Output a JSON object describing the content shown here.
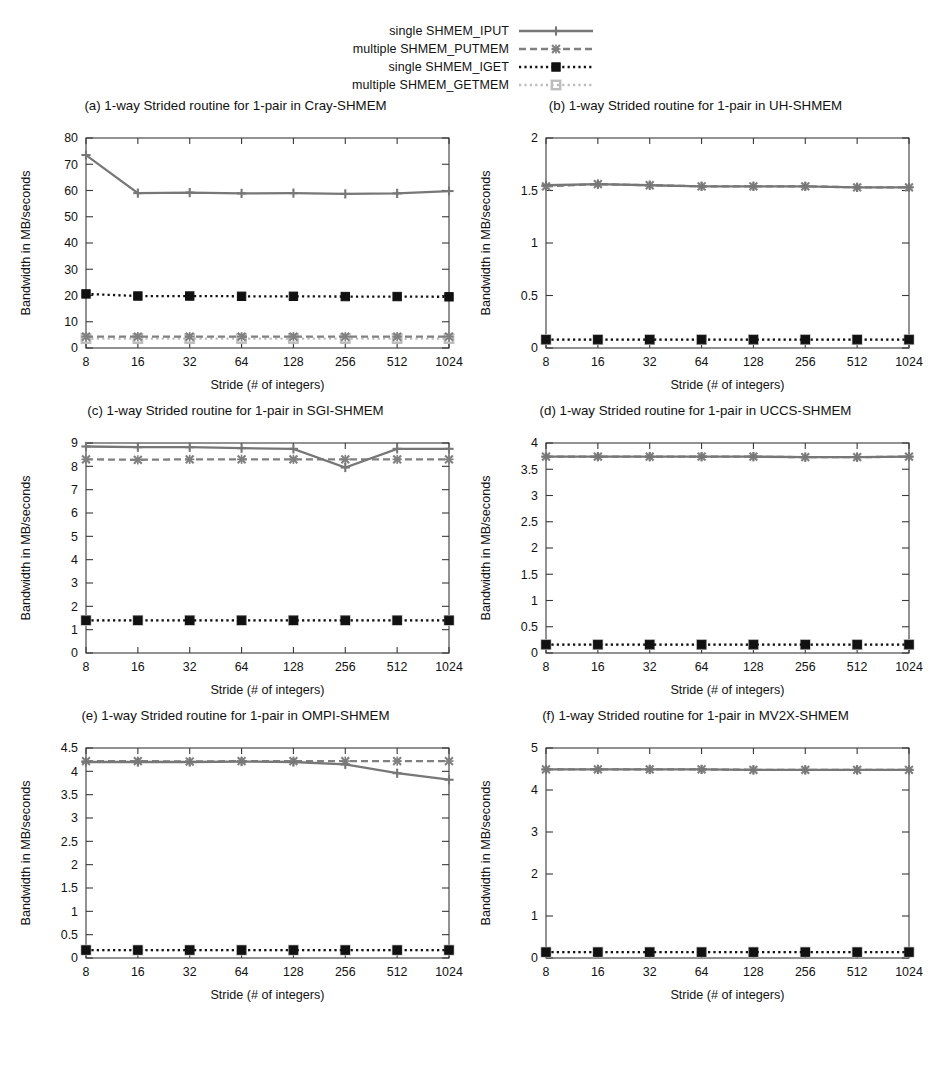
{
  "legend": {
    "entries": [
      {
        "label": "single SHMEM_IPUT",
        "key": "iput",
        "color": "#777777",
        "dash": "solid",
        "marker": "plus"
      },
      {
        "label": "multiple SHMEM_PUTMEM",
        "key": "putmem",
        "color": "#808080",
        "dash": "dashed",
        "marker": "cross"
      },
      {
        "label": "single SHMEM_IGET",
        "key": "iget",
        "color": "#111111",
        "dash": "dotted",
        "marker": "square-filled"
      },
      {
        "label": "multiple SHMEM_GETMEM",
        "key": "getmem",
        "color": "#bdbdbd",
        "dash": "dotted",
        "marker": "square-open"
      }
    ]
  },
  "axes": {
    "xlabel": "Stride (# of integers)",
    "ylabel": "Bandwidth in MB/seconds",
    "categories": [
      "8",
      "16",
      "32",
      "64",
      "128",
      "256",
      "512",
      "1024"
    ]
  },
  "chart_data": [
    {
      "id": "a",
      "type": "line",
      "title": "(a) 1-way Strided routine for 1-pair in Cray-SHMEM",
      "xlabel": "Stride (# of integers)",
      "ylabel": "Bandwidth in MB/seconds",
      "categories": [
        "8",
        "16",
        "32",
        "64",
        "128",
        "256",
        "512",
        "1024"
      ],
      "ylim": [
        0,
        80
      ],
      "yticks": [
        0,
        10,
        20,
        30,
        40,
        50,
        60,
        70,
        80
      ],
      "ytick_labels": [
        "0",
        "10",
        "20",
        "30",
        "40",
        "50",
        "60",
        "70",
        "80"
      ],
      "grid": false,
      "legend_position": "figure-top",
      "series": [
        {
          "name": "single SHMEM_IPUT",
          "values": [
            73.5,
            59.0,
            59.2,
            58.9,
            59.0,
            58.7,
            58.9,
            59.8
          ]
        },
        {
          "name": "multiple SHMEM_PUTMEM",
          "values": [
            4.3,
            4.3,
            4.3,
            4.3,
            4.3,
            4.3,
            4.3,
            4.3
          ]
        },
        {
          "name": "single SHMEM_IGET",
          "values": [
            20.6,
            19.8,
            19.8,
            19.7,
            19.7,
            19.6,
            19.6,
            19.5
          ]
        },
        {
          "name": "multiple SHMEM_GETMEM",
          "values": [
            3.6,
            3.6,
            3.6,
            3.6,
            3.6,
            3.6,
            3.6,
            3.6
          ]
        }
      ]
    },
    {
      "id": "b",
      "type": "line",
      "title": "(b) 1-way Strided routine for 1-pair in UH-SHMEM",
      "xlabel": "Stride (# of integers)",
      "ylabel": "Bandwidth in MB/seconds",
      "categories": [
        "8",
        "16",
        "32",
        "64",
        "128",
        "256",
        "512",
        "1024"
      ],
      "ylim": [
        0,
        2
      ],
      "yticks": [
        0,
        0.5,
        1,
        1.5,
        2
      ],
      "ytick_labels": [
        "0",
        "0.5",
        "1",
        "1.5",
        "2"
      ],
      "grid": false,
      "legend_position": "figure-top",
      "series": [
        {
          "name": "single SHMEM_IPUT",
          "values": [
            1.55,
            1.56,
            1.55,
            1.54,
            1.54,
            1.54,
            1.53,
            1.53
          ]
        },
        {
          "name": "multiple SHMEM_PUTMEM",
          "values": [
            1.54,
            1.56,
            1.55,
            1.54,
            1.54,
            1.54,
            1.53,
            1.53
          ]
        },
        {
          "name": "single SHMEM_IGET",
          "values": [
            0.08,
            0.08,
            0.08,
            0.08,
            0.08,
            0.08,
            0.08,
            0.08
          ]
        },
        {
          "name": "multiple SHMEM_GETMEM",
          "values": [
            0.08,
            0.08,
            0.08,
            0.08,
            0.08,
            0.08,
            0.08,
            0.08
          ]
        }
      ]
    },
    {
      "id": "c",
      "type": "line",
      "title": "(c) 1-way Strided routine for 1-pair in SGI-SHMEM",
      "xlabel": "Stride (# of integers)",
      "ylabel": "Bandwidth in MB/seconds",
      "categories": [
        "8",
        "16",
        "32",
        "64",
        "128",
        "256",
        "512",
        "1024"
      ],
      "ylim": [
        0,
        9
      ],
      "yticks": [
        0,
        1,
        2,
        3,
        4,
        5,
        6,
        7,
        8,
        9
      ],
      "ytick_labels": [
        "0",
        "1",
        "2",
        "3",
        "4",
        "5",
        "6",
        "7",
        "8",
        "9"
      ],
      "grid": false,
      "legend_position": "figure-top",
      "series": [
        {
          "name": "single SHMEM_IPUT",
          "values": [
            8.85,
            8.82,
            8.82,
            8.78,
            8.75,
            7.95,
            8.75,
            8.75
          ]
        },
        {
          "name": "multiple SHMEM_PUTMEM",
          "values": [
            8.3,
            8.28,
            8.3,
            8.3,
            8.3,
            8.3,
            8.3,
            8.3
          ]
        },
        {
          "name": "single SHMEM_IGET",
          "values": [
            1.4,
            1.4,
            1.4,
            1.4,
            1.4,
            1.4,
            1.4,
            1.4
          ]
        },
        {
          "name": "multiple SHMEM_GETMEM",
          "values": [
            1.4,
            1.4,
            1.4,
            1.4,
            1.4,
            1.4,
            1.4,
            1.4
          ]
        }
      ]
    },
    {
      "id": "d",
      "type": "line",
      "title": "(d) 1-way Strided routine for 1-pair in UCCS-SHMEM",
      "xlabel": "Stride (# of integers)",
      "ylabel": "Bandwidth in MB/seconds",
      "categories": [
        "8",
        "16",
        "32",
        "64",
        "128",
        "256",
        "512",
        "1024"
      ],
      "ylim": [
        0,
        4
      ],
      "yticks": [
        0,
        0.5,
        1,
        1.5,
        2,
        2.5,
        3,
        3.5,
        4
      ],
      "ytick_labels": [
        "0",
        "0.5",
        "1",
        "1.5",
        "2",
        "2.5",
        "3",
        "3.5",
        "4"
      ],
      "grid": false,
      "legend_position": "figure-top",
      "series": [
        {
          "name": "single SHMEM_IPUT",
          "values": [
            3.74,
            3.74,
            3.74,
            3.74,
            3.74,
            3.73,
            3.73,
            3.74
          ]
        },
        {
          "name": "multiple SHMEM_PUTMEM",
          "values": [
            3.74,
            3.74,
            3.74,
            3.74,
            3.74,
            3.73,
            3.73,
            3.74
          ]
        },
        {
          "name": "single SHMEM_IGET",
          "values": [
            0.16,
            0.16,
            0.16,
            0.16,
            0.16,
            0.16,
            0.16,
            0.16
          ]
        },
        {
          "name": "multiple SHMEM_GETMEM",
          "values": [
            0.16,
            0.16,
            0.16,
            0.16,
            0.16,
            0.16,
            0.16,
            0.16
          ]
        }
      ]
    },
    {
      "id": "e",
      "type": "line",
      "title": "(e) 1-way Strided routine for 1-pair in OMPI-SHMEM",
      "xlabel": "Stride (# of integers)",
      "ylabel": "Bandwidth in MB/seconds",
      "categories": [
        "8",
        "16",
        "32",
        "64",
        "128",
        "256",
        "512",
        "1024"
      ],
      "ylim": [
        0,
        4.5
      ],
      "yticks": [
        0,
        0.5,
        1,
        1.5,
        2,
        2.5,
        3,
        3.5,
        4,
        4.5
      ],
      "ytick_labels": [
        "0",
        "0.5",
        "1",
        "1.5",
        "2",
        "2.5",
        "3",
        "3.5",
        "4",
        "4.5"
      ],
      "grid": false,
      "legend_position": "figure-top",
      "series": [
        {
          "name": "single SHMEM_IPUT",
          "values": [
            4.2,
            4.2,
            4.2,
            4.21,
            4.2,
            4.15,
            3.96,
            3.82
          ]
        },
        {
          "name": "multiple SHMEM_PUTMEM",
          "values": [
            4.22,
            4.22,
            4.21,
            4.22,
            4.22,
            4.22,
            4.22,
            4.22
          ]
        },
        {
          "name": "single SHMEM_IGET",
          "values": [
            0.17,
            0.17,
            0.17,
            0.17,
            0.17,
            0.17,
            0.17,
            0.17
          ]
        },
        {
          "name": "multiple SHMEM_GETMEM",
          "values": [
            0.17,
            0.17,
            0.17,
            0.17,
            0.17,
            0.17,
            0.17,
            0.17
          ]
        }
      ]
    },
    {
      "id": "f",
      "type": "line",
      "title": "(f) 1-way Strided routine for 1-pair in MV2X-SHMEM",
      "xlabel": "Stride (# of integers)",
      "ylabel": "Bandwidth in MB/seconds",
      "categories": [
        "8",
        "16",
        "32",
        "64",
        "128",
        "256",
        "512",
        "1024"
      ],
      "ylim": [
        0,
        5
      ],
      "yticks": [
        0,
        1,
        2,
        3,
        4,
        5
      ],
      "ytick_labels": [
        "0",
        "1",
        "2",
        "3",
        "4",
        "5"
      ],
      "grid": false,
      "legend_position": "figure-top",
      "series": [
        {
          "name": "single SHMEM_IPUT",
          "values": [
            4.49,
            4.49,
            4.49,
            4.49,
            4.48,
            4.48,
            4.48,
            4.48
          ]
        },
        {
          "name": "multiple SHMEM_PUTMEM",
          "values": [
            4.49,
            4.49,
            4.49,
            4.49,
            4.48,
            4.48,
            4.48,
            4.48
          ]
        },
        {
          "name": "single SHMEM_IGET",
          "values": [
            0.14,
            0.14,
            0.14,
            0.14,
            0.14,
            0.14,
            0.14,
            0.14
          ]
        },
        {
          "name": "multiple SHMEM_GETMEM",
          "values": [
            0.14,
            0.14,
            0.14,
            0.14,
            0.14,
            0.14,
            0.14,
            0.14
          ]
        }
      ]
    }
  ]
}
